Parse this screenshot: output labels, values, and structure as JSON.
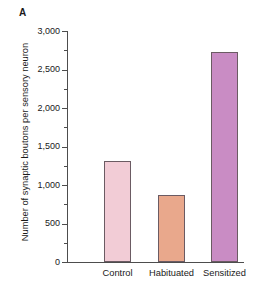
{
  "panel": {
    "letter": "A"
  },
  "chart_data": {
    "type": "bar",
    "title": "",
    "xlabel": "",
    "ylabel": "Number of synaptic boutons per sensory neuron",
    "categories": [
      "Control",
      "Habituated",
      "Sensitized"
    ],
    "values": [
      1310,
      870,
      2730
    ],
    "series": [
      {
        "name": "Number of synaptic boutons per sensory neuron",
        "values": [
          1310,
          870,
          2730
        ]
      }
    ],
    "bar_colors": [
      "#f2ccd6",
      "#e9a88c",
      "#c98cc4"
    ],
    "bar_edge_color": "#6b5b63",
    "ylim": [
      0,
      3000
    ],
    "ytick_values": [
      0,
      500,
      1000,
      1500,
      2000,
      2500,
      3000
    ],
    "ytick_labels": [
      "0",
      "500",
      "1,000",
      "1,500",
      "2,000",
      "2,500",
      "3,000"
    ],
    "yminor_tick_values": [
      250,
      750,
      1250,
      1750,
      2250,
      2750
    ],
    "grid": false,
    "legend": null,
    "legend_position": "none",
    "axis_color": "#4d4d4d"
  }
}
